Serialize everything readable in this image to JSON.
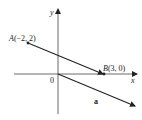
{
  "diagram": {
    "axes": {
      "x_label": "x",
      "y_label": "y",
      "origin_label": "0"
    },
    "points": [
      {
        "name": "A",
        "coords": "(−2, 2)",
        "x": -2,
        "y": 2
      },
      {
        "name": "B",
        "coords": "(3, 0)",
        "x": 3,
        "y": 0
      }
    ],
    "segment": {
      "from": "A",
      "to": "B",
      "arrow_at": "B"
    },
    "vector": {
      "label": "a",
      "from": [
        0,
        0
      ],
      "direction": "parallel to AB"
    },
    "colors": {
      "stroke": "#222222",
      "background": "#ffffff"
    }
  }
}
